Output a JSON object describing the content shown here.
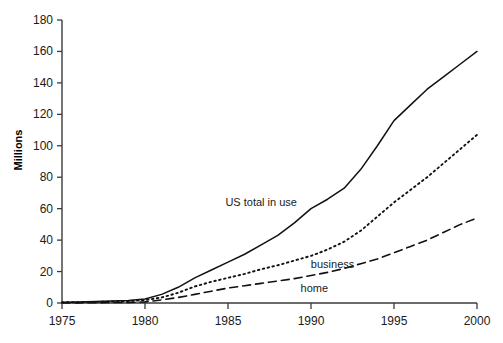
{
  "chart_data": {
    "type": "line",
    "title": "",
    "subtitle": "",
    "xlabel": "",
    "ylabel": "Millions",
    "xlim": [
      1975,
      2000
    ],
    "ylim": [
      0,
      180
    ],
    "grid": false,
    "legend_position": "inline-annotations",
    "x": [
      1975,
      1976,
      1977,
      1978,
      1979,
      1980,
      1981,
      1982,
      1983,
      1984,
      1985,
      1986,
      1987,
      1988,
      1989,
      1990,
      1991,
      1992,
      1993,
      1994,
      1995,
      1996,
      1997,
      1998,
      1999,
      2000
    ],
    "xticks": [
      "1975",
      "1980",
      "1985",
      "1990",
      "1995",
      "2000"
    ],
    "xtick_values": [
      1975,
      1980,
      1985,
      1990,
      1995,
      2000
    ],
    "yticks": [
      "0",
      "20",
      "40",
      "60",
      "80",
      "100",
      "120",
      "140",
      "160",
      "180"
    ],
    "ytick_values": [
      0,
      20,
      40,
      60,
      80,
      100,
      120,
      140,
      160,
      180
    ],
    "series": [
      {
        "name": "US total in use",
        "style": "solid",
        "label_x": 1987.0,
        "label_y": 62,
        "values": [
          0.5,
          0.7,
          0.9,
          1.2,
          1.6,
          2.5,
          5.5,
          10.0,
          16.0,
          21.0,
          26.0,
          31.0,
          37.0,
          43.0,
          51.0,
          60.0,
          66.0,
          73.0,
          85.0,
          100.0,
          116.0,
          126.0,
          136.0,
          144.0,
          152.0,
          160.0
        ]
      },
      {
        "name": "business",
        "style": "dotted",
        "label_x": 1991.3,
        "label_y": 22,
        "values": [
          0.4,
          0.5,
          0.7,
          0.9,
          1.2,
          1.8,
          3.5,
          6.5,
          10.5,
          13.5,
          16.0,
          18.5,
          21.5,
          24.0,
          27.0,
          30.0,
          34.0,
          39.0,
          46.0,
          55.0,
          64.0,
          72.0,
          80.0,
          89.0,
          98.0,
          107.0
        ]
      },
      {
        "name": "home",
        "style": "dashed",
        "label_x": 1990.2,
        "label_y": 7,
        "values": [
          0.1,
          0.1,
          0.2,
          0.3,
          0.4,
          0.7,
          2.0,
          3.5,
          5.5,
          7.5,
          9.5,
          11.0,
          12.5,
          14.0,
          15.5,
          17.5,
          19.5,
          22.0,
          25.0,
          28.0,
          32.0,
          36.0,
          40.0,
          45.0,
          50.0,
          54.0
        ]
      }
    ]
  }
}
